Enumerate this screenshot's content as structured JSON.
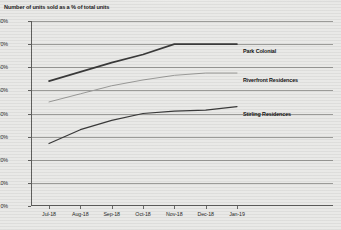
{
  "chart_data": {
    "type": "line",
    "title": "Number of units sold as a % of total units",
    "xlabel": "",
    "ylabel": "",
    "ylim": [
      0,
      80
    ],
    "yunit": "%",
    "grid": true,
    "legend_position": "inline-right-of-line-end",
    "categories": [
      "Jul-18",
      "Aug-18",
      "Sep-18",
      "Oct-18",
      "Nov-18",
      "Dec-18",
      "Jan-19"
    ],
    "yticks": [
      "0%",
      "10%",
      "20%",
      "30%",
      "40%",
      "50%",
      "60%",
      "70%",
      "80%"
    ],
    "ytick_values": [
      0,
      10,
      20,
      30,
      40,
      50,
      60,
      70,
      80
    ],
    "series": [
      {
        "name": "Park Colonial",
        "color": "#3a3a3a",
        "width": 1.6,
        "values": [
          54,
          58,
          62,
          65.5,
          70,
          70,
          70
        ]
      },
      {
        "name": "Riverfront Residences",
        "color": "#9a9a98",
        "width": 1.0,
        "values": [
          45,
          48.5,
          52,
          54.5,
          56.5,
          57.5,
          57.5
        ]
      },
      {
        "name": "Stirling Residences",
        "color": "#3a3a3a",
        "width": 1.2,
        "values": [
          27,
          33,
          37,
          40,
          41,
          41.5,
          43
        ]
      }
    ]
  }
}
